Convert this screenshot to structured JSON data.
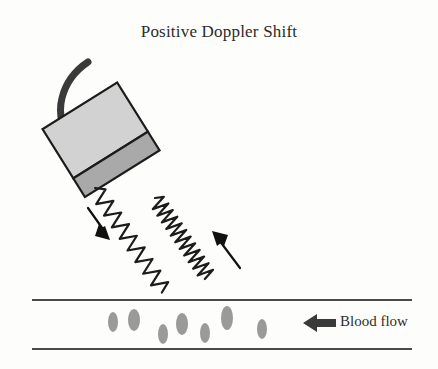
{
  "figure": {
    "title": "Positive Doppler Shift",
    "background_color": "#fdfdfc",
    "ink_color": "#2b2b2b"
  },
  "labels": {
    "blood_flow": "Blood flow"
  },
  "transducer": {
    "body_color": "#d2d2d2",
    "face_color": "#a9a9a9",
    "outline_color": "#1c1c1c",
    "cable_color": "#3a3a3a",
    "rotation_degrees": -32,
    "center_x": 100,
    "center_y": 138
  },
  "waves": {
    "transmitted": {
      "name": "transmitted-wave",
      "direction": "down-right",
      "wavelength_label": "long",
      "color": "#1c1c1c"
    },
    "reflected": {
      "name": "reflected-wave",
      "direction": "up-right",
      "wavelength_label": "short",
      "color": "#1c1c1c"
    }
  },
  "arrows": {
    "transmitted_arrow": {
      "direction": "down-right",
      "color": "#111111"
    },
    "reflected_arrow": {
      "direction": "up-left",
      "color": "#111111"
    },
    "flow_arrow": {
      "direction": "left",
      "color": "#3a3a3a"
    }
  },
  "vessel": {
    "top_line_y": 300,
    "bottom_line_y": 349,
    "left_x": 32,
    "right_x": 412,
    "line_color": "#4a4a4a",
    "cell_color": "#9a9a9a",
    "cells": [
      {
        "cx": 113,
        "cy": 322,
        "rx": 5,
        "ry": 10
      },
      {
        "cx": 134,
        "cy": 320,
        "rx": 6,
        "ry": 11
      },
      {
        "cx": 163,
        "cy": 334,
        "rx": 5,
        "ry": 10
      },
      {
        "cx": 182,
        "cy": 324,
        "rx": 6,
        "ry": 11
      },
      {
        "cx": 205,
        "cy": 333,
        "rx": 5,
        "ry": 10
      },
      {
        "cx": 227,
        "cy": 318,
        "rx": 6,
        "ry": 12
      },
      {
        "cx": 262,
        "cy": 329,
        "rx": 5,
        "ry": 10
      }
    ]
  }
}
